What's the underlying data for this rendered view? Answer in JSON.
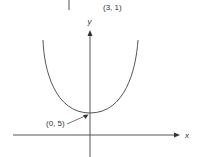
{
  "diagram": {
    "type": "parabola-graph",
    "top_label": "(3, 1)",
    "y_axis_label": "y",
    "x_axis_label": "x",
    "vertex_label": "(0, 5)",
    "colors": {
      "line": "#555555",
      "text": "#333333",
      "background": "#ffffff"
    }
  }
}
